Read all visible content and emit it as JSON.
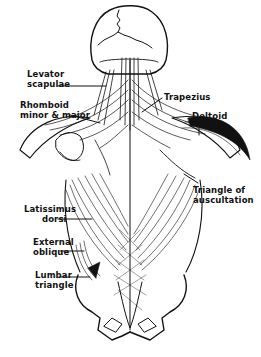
{
  "diagram": {
    "colors": {
      "ink": "#111111",
      "background": "#ffffff"
    },
    "labels": [
      {
        "id": "levator-scapulae",
        "lines": [
          "Levator",
          "scapulae"
        ]
      },
      {
        "id": "rhomboid",
        "lines": [
          "Rhomboid",
          "minor & major"
        ]
      },
      {
        "id": "trapezius",
        "lines": [
          "Trapezius"
        ]
      },
      {
        "id": "deltoid",
        "lines": [
          "Deltoid"
        ]
      },
      {
        "id": "triangle-of-auscultation",
        "lines": [
          "Triangle of",
          "auscultation"
        ]
      },
      {
        "id": "latissimus-dorsi",
        "lines": [
          "Latissimus",
          "dorsi"
        ]
      },
      {
        "id": "external-oblique",
        "lines": [
          "External",
          "oblique"
        ]
      },
      {
        "id": "lumbar-triangle",
        "lines": [
          "Lumbar",
          "triangle"
        ]
      }
    ]
  }
}
